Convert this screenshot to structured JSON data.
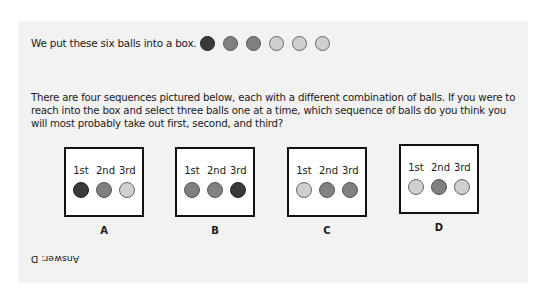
{
  "intro": {
    "text": "We put these six balls into a box.",
    "balls": [
      "dark",
      "mid",
      "mid",
      "light",
      "light",
      "light"
    ]
  },
  "question": "There are four sequences pictured below, each with a different combination of balls. If you were to reach into the box and select three balls one at a time, which sequence of balls do you think you will most probably take out first, second, and third?",
  "ordinals": [
    "1st",
    "2nd",
    "3rd"
  ],
  "options": [
    {
      "label": "A",
      "balls": [
        "dark",
        "mid",
        "light"
      ]
    },
    {
      "label": "B",
      "balls": [
        "mid",
        "mid",
        "dark"
      ]
    },
    {
      "label": "C",
      "balls": [
        "light",
        "mid",
        "mid"
      ]
    },
    {
      "label": "D",
      "balls": [
        "light",
        "mid",
        "light"
      ]
    }
  ],
  "answer": "Answer: D"
}
